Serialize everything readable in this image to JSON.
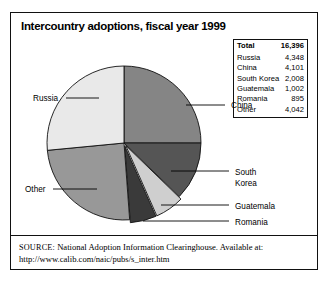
{
  "figure": {
    "title": "Intercountry adoptions, fiscal year 1999"
  },
  "table": {
    "total_label": "Total",
    "total_value": "16,396",
    "rows": [
      {
        "label": "Russia",
        "value": "4,348"
      },
      {
        "label": "China",
        "value": "4,101"
      },
      {
        "label": "South Korea",
        "value": "2,008"
      },
      {
        "label": "Guatemala",
        "value": "1,002"
      },
      {
        "label": "Romania",
        "value": "895"
      },
      {
        "label": "Other",
        "value": "4,042"
      }
    ]
  },
  "labels": {
    "russia": "Russia",
    "china": "China",
    "south_korea_line1": "South",
    "south_korea_line2": "Korea",
    "guatemala": "Guatemala",
    "romania": "Romania",
    "other": "Other"
  },
  "source": {
    "label": "SOURCE:",
    "text": "National Adoption Information Clearinghouse. Available at:",
    "url": "http://www.calib.com/naic/pubs/s_inter.htm"
  },
  "chart_data": {
    "type": "pie",
    "title": "Intercountry adoptions, fiscal year 1999",
    "total": 16396,
    "categories": [
      "China",
      "South Korea",
      "Guatemala",
      "Romania",
      "Other",
      "Russia"
    ],
    "values": [
      4101,
      2008,
      1002,
      895,
      4042,
      4348
    ],
    "percents": [
      25.0,
      12.2,
      6.1,
      5.5,
      24.7,
      26.5
    ],
    "colors": [
      "#858585",
      "#555555",
      "#cfcfcf",
      "#3a3a3a",
      "#989898",
      "#e9e9e9"
    ],
    "start_angle_deg": 0,
    "direction": "clockwise",
    "legend": "none",
    "grid": false,
    "exploded_slices": [
      "Guatemala",
      "Romania"
    ]
  }
}
